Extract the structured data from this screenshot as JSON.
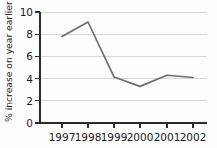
{
  "chart_data": {
    "type": "line",
    "title": "",
    "subtitle": "",
    "xlabel": "",
    "ylabel": "% increase on year earlier",
    "categories": [
      "1997",
      "1998",
      "1999",
      "2000",
      "2001",
      "2002"
    ],
    "values": [
      7.8,
      9.1,
      4.15,
      3.3,
      4.3,
      4.1
    ],
    "series": [
      {
        "name": "% increase on year earlier",
        "values": [
          7.8,
          9.1,
          4.15,
          3.3,
          4.3,
          4.1
        ]
      }
    ],
    "ylim": [
      0,
      10
    ],
    "yticks": [
      0,
      2,
      4,
      6,
      8,
      10
    ],
    "ytick_labels": [
      "0",
      "2",
      "4",
      "6",
      "8",
      "10"
    ],
    "xtick_labels": [
      "1997",
      "1998",
      "1999",
      "2000",
      "2001",
      "2002"
    ],
    "grid": true,
    "grid_axis": "y",
    "legend": false,
    "legend_position": "none",
    "line_color": "#6e6e6e",
    "axis_color": "#2b2b2b",
    "grid_color": "#d8d8d8",
    "background_color": "#fdfdfd"
  }
}
